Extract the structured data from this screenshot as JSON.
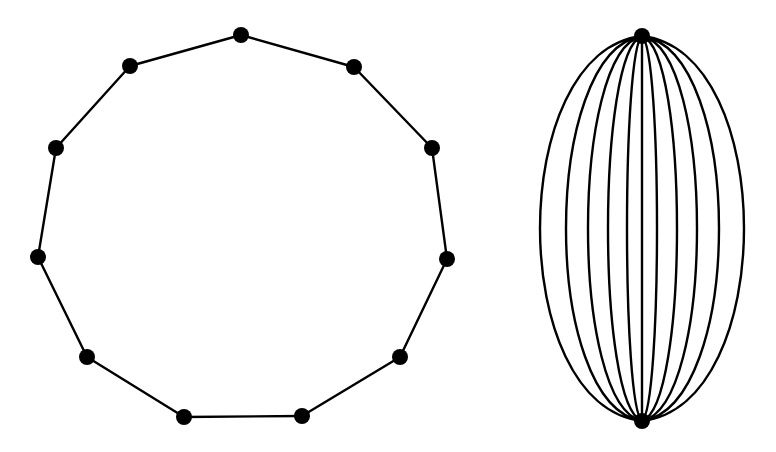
{
  "diagram": {
    "colors": {
      "background": "#ffffff",
      "stroke": "#000000",
      "node": "#000000"
    },
    "node_radius": 8,
    "cycle_graph": {
      "label": "",
      "description": "cycle graph with 11 vertices",
      "vertex_count": 11,
      "vertices": [
        {
          "id": 0,
          "x": 241,
          "y": 35
        },
        {
          "id": 1,
          "x": 354,
          "y": 67
        },
        {
          "id": 2,
          "x": 432,
          "y": 148
        },
        {
          "id": 3,
          "x": 447,
          "y": 259
        },
        {
          "id": 4,
          "x": 400,
          "y": 357
        },
        {
          "id": 5,
          "x": 302,
          "y": 416
        },
        {
          "id": 6,
          "x": 184,
          "y": 417
        },
        {
          "id": 7,
          "x": 87,
          "y": 357
        },
        {
          "id": 8,
          "x": 38,
          "y": 257
        },
        {
          "id": 9,
          "x": 56,
          "y": 148
        },
        {
          "id": 10,
          "x": 130,
          "y": 66
        }
      ],
      "edges": [
        [
          0,
          1
        ],
        [
          1,
          2
        ],
        [
          2,
          3
        ],
        [
          3,
          4
        ],
        [
          4,
          5
        ],
        [
          5,
          6
        ],
        [
          6,
          7
        ],
        [
          7,
          8
        ],
        [
          8,
          9
        ],
        [
          9,
          10
        ],
        [
          10,
          0
        ]
      ]
    },
    "multigraph": {
      "label": "",
      "description": "two vertices joined by 11 parallel edges",
      "vertices": [
        {
          "id": "top",
          "x": 642,
          "y": 36
        },
        {
          "id": "bottom",
          "x": 642,
          "y": 421
        }
      ],
      "edge_count": 11,
      "edge_mid_offsets": [
        -102,
        -76,
        -54,
        -34,
        -15,
        0,
        15,
        35,
        55,
        77,
        102
      ]
    }
  }
}
